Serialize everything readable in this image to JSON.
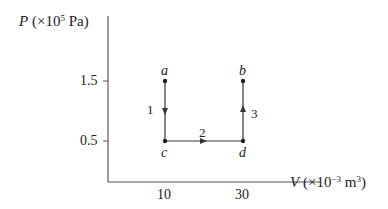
{
  "diagram": {
    "y_axis": {
      "symbol": "P",
      "unit_prefix": "(×10",
      "unit_exp": "5",
      "unit_suffix": " Pa)",
      "ticks": [
        {
          "value": 1.5,
          "label": "1.5"
        },
        {
          "value": 0.5,
          "label": "0.5"
        }
      ]
    },
    "x_axis": {
      "symbol": "V",
      "unit_prefix": "(×10",
      "unit_exp": "−3",
      "unit_mid": " m",
      "unit_exp2": "3",
      "unit_suffix": ")",
      "ticks": [
        {
          "value": 10,
          "label": "10"
        },
        {
          "value": 30,
          "label": "30"
        }
      ]
    },
    "points": [
      {
        "name": "a",
        "V": 10,
        "P": 1.5
      },
      {
        "name": "b",
        "V": 30,
        "P": 1.5
      },
      {
        "name": "c",
        "V": 10,
        "P": 0.5
      },
      {
        "name": "d",
        "V": 30,
        "P": 0.5
      }
    ],
    "processes": [
      {
        "label": "1",
        "from": "a",
        "to": "c"
      },
      {
        "label": "2",
        "from": "c",
        "to": "d"
      },
      {
        "label": "3",
        "from": "d",
        "to": "b"
      }
    ],
    "colors": {
      "line": "#333333",
      "axis": "#555555"
    }
  }
}
